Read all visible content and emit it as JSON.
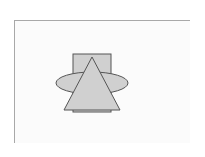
{
  "canvas": {
    "background": "#fbfbfb",
    "frame_color": "#a8a8a8"
  },
  "style": {
    "shape_fill": "#d0d0d0",
    "shape_stroke": "#555555"
  },
  "shapes": [
    {
      "type": "rectangle",
      "name": "square-shape"
    },
    {
      "type": "ellipse",
      "name": "ellipse-shape"
    },
    {
      "type": "triangle",
      "name": "triangle-shape"
    }
  ]
}
